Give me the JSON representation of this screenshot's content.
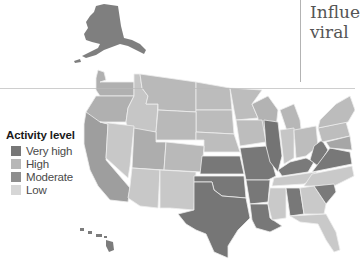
{
  "title": {
    "line1": "Influe",
    "line2": "viral"
  },
  "legend": {
    "title": "Activity level",
    "items": [
      {
        "label": "Very high",
        "color": "#777777"
      },
      {
        "label": "High",
        "color": "#b7b7b7"
      },
      {
        "label": "Moderate",
        "color": "#8e8e8e"
      },
      {
        "label": "Low",
        "color": "#d6d6d6"
      }
    ]
  },
  "map": {
    "colors": {
      "very_high": "#777777",
      "high": "#b5b5b5",
      "moderate": "#8e8e8e",
      "low": "#d2d2d2",
      "mid": "#a9a9a9"
    },
    "regions": [
      {
        "name": "Alaska",
        "level": "Moderate"
      },
      {
        "name": "Hawaii",
        "level": "Moderate"
      },
      {
        "name": "Texas",
        "level": "Very high"
      },
      {
        "name": "Oklahoma",
        "level": "Very high"
      },
      {
        "name": "Kansas",
        "level": "Very high"
      },
      {
        "name": "Missouri",
        "level": "Very high"
      },
      {
        "name": "Arkansas",
        "level": "Very high"
      },
      {
        "name": "Louisiana",
        "level": "Very high"
      },
      {
        "name": "Illinois",
        "level": "Very high"
      },
      {
        "name": "Kentucky",
        "level": "Very high"
      },
      {
        "name": "West Virginia",
        "level": "Very high"
      },
      {
        "name": "Virginia",
        "level": "Very high"
      },
      {
        "name": "Alabama",
        "level": "Very high"
      },
      {
        "name": "South Carolina",
        "level": "Very high"
      },
      {
        "name": "California",
        "level": "Moderate"
      },
      {
        "name": "Oregon",
        "level": "High"
      },
      {
        "name": "Washington",
        "level": "High"
      },
      {
        "name": "Nevada",
        "level": "Low"
      },
      {
        "name": "Arizona",
        "level": "Low"
      },
      {
        "name": "New Mexico",
        "level": "Low"
      },
      {
        "name": "Mississippi",
        "level": "Low"
      },
      {
        "name": "Georgia",
        "level": "Low"
      },
      {
        "name": "Florida",
        "level": "Low"
      },
      {
        "name": "Tennessee",
        "level": "Low"
      },
      {
        "name": "North Carolina",
        "level": "Low"
      },
      {
        "name": "Idaho",
        "level": "Low"
      },
      {
        "name": "Indiana",
        "level": "Low"
      },
      {
        "name": "Ohio",
        "level": "Low"
      }
    ]
  }
}
